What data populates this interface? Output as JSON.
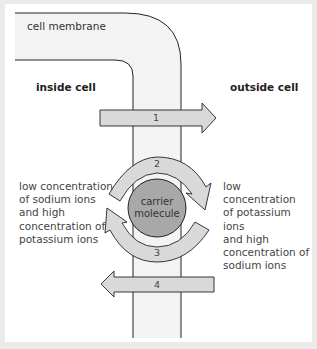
{
  "diagram": {
    "membrane_label": "cell membrane",
    "inside_label": "inside cell",
    "outside_label": "outside cell",
    "carrier_label_line1": "carrier",
    "carrier_label_line2": "molecule",
    "arrows": [
      {
        "id": "1",
        "label": "1",
        "direction": "right"
      },
      {
        "id": "2",
        "label": "2",
        "direction": "clockwise-top"
      },
      {
        "id": "3",
        "label": "3",
        "direction": "clockwise-bottom"
      },
      {
        "id": "4",
        "label": "4",
        "direction": "left"
      }
    ],
    "left_description": [
      "low concentration",
      "of sodium ions",
      "and high",
      "concentration of",
      "potassium ions"
    ],
    "right_description": [
      "low concentration",
      "of potassium ions",
      "and high",
      "concentration of",
      "sodium ions"
    ],
    "colors": {
      "frame": "#ebebeb",
      "membrane_fill": "#f2f2f2",
      "arrow_fill": "#d9d9d9",
      "carrier_fill": "#a6a6a6",
      "stroke": "#222222"
    }
  }
}
